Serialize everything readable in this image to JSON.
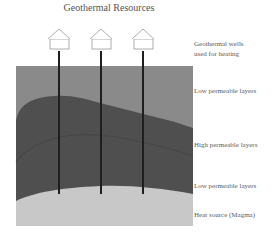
{
  "title": "Geothermal Resources",
  "labels": {
    "wells_line1": "Geothermal wells",
    "wells_line2": "used for heating",
    "layer_top": "Low permeable layers",
    "layer_middle": "High permeable layers",
    "layer_lower": "Low permeable layers",
    "heat_source": "Heat source  (Magma)"
  },
  "houses": [
    {
      "name": "house-1",
      "x": 59
    },
    {
      "name": "house-2",
      "x": 101
    },
    {
      "name": "house-3",
      "x": 143
    }
  ],
  "colors": {
    "upper_low_permeable": "#8a8a8a",
    "high_permeable": "#4f4f4f",
    "inner_boundary": "#444444",
    "magma": "#c8c8c8",
    "well": "#1e1e1e",
    "house_outline": "#999999"
  }
}
